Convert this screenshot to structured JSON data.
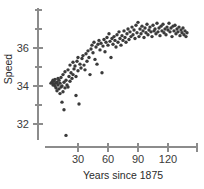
{
  "chart_data": {
    "type": "scatter",
    "title": "",
    "xlabel": "Years since 1875",
    "ylabel": "Speed",
    "xlim": [
      0,
      145
    ],
    "ylim": [
      31,
      37.5
    ],
    "xticks": [
      30,
      60,
      90,
      120
    ],
    "xtick_labels": [
      "30",
      "60",
      "90",
      "120"
    ],
    "yticks": [
      32,
      34,
      36
    ],
    "ytick_labels": [
      "32",
      "34",
      "36"
    ],
    "grid": false,
    "legend": null,
    "marker_color": "#3b3b3b",
    "axis_color": "#8c8c8c",
    "points": [
      [
        3,
        34.15
      ],
      [
        4,
        34.2
      ],
      [
        5,
        34.05
      ],
      [
        5,
        34.3
      ],
      [
        6,
        34.1
      ],
      [
        6,
        34.25
      ],
      [
        7,
        34.0
      ],
      [
        7,
        34.35
      ],
      [
        8,
        34.15
      ],
      [
        8,
        33.9
      ],
      [
        9,
        34.2
      ],
      [
        9,
        33.75
      ],
      [
        10,
        34.05
      ],
      [
        10,
        34.4
      ],
      [
        11,
        33.85
      ],
      [
        11,
        34.3
      ],
      [
        12,
        33.6
      ],
      [
        12,
        34.15
      ],
      [
        13,
        33.95
      ],
      [
        13,
        34.45
      ],
      [
        14,
        33.15
      ],
      [
        14,
        34.0
      ],
      [
        15,
        33.7
      ],
      [
        15,
        34.6
      ],
      [
        16,
        34.2
      ],
      [
        16,
        32.75
      ],
      [
        17,
        33.9
      ],
      [
        17,
        34.75
      ],
      [
        18,
        34.3
      ],
      [
        18,
        31.4
      ],
      [
        19,
        34.05
      ],
      [
        20,
        34.85
      ],
      [
        20,
        33.95
      ],
      [
        21,
        34.5
      ],
      [
        22,
        35.1
      ],
      [
        22,
        34.25
      ],
      [
        23,
        34.7
      ],
      [
        24,
        34.4
      ],
      [
        25,
        35.25
      ],
      [
        25,
        34.6
      ],
      [
        26,
        34.9
      ],
      [
        27,
        35.05
      ],
      [
        28,
        34.5
      ],
      [
        28,
        33.5
      ],
      [
        29,
        35.3
      ],
      [
        30,
        34.8
      ],
      [
        30,
        35.5
      ],
      [
        31,
        33.05
      ],
      [
        32,
        35.15
      ],
      [
        33,
        34.95
      ],
      [
        34,
        35.45
      ],
      [
        35,
        35.6
      ],
      [
        36,
        35.1
      ],
      [
        37,
        34.85
      ],
      [
        38,
        35.7
      ],
      [
        39,
        35.3
      ],
      [
        40,
        35.85
      ],
      [
        41,
        35.5
      ],
      [
        42,
        34.6
      ],
      [
        43,
        35.95
      ],
      [
        44,
        36.15
      ],
      [
        45,
        35.75
      ],
      [
        46,
        36.3
      ],
      [
        47,
        35.4
      ],
      [
        48,
        36.05
      ],
      [
        49,
        35.15
      ],
      [
        50,
        36.2
      ],
      [
        51,
        36.4
      ],
      [
        52,
        35.9
      ],
      [
        53,
        36.25
      ],
      [
        54,
        34.7
      ],
      [
        55,
        36.1
      ],
      [
        56,
        36.45
      ],
      [
        57,
        35.8
      ],
      [
        58,
        36.3
      ],
      [
        59,
        36.55
      ],
      [
        60,
        36.15
      ],
      [
        61,
        36.75
      ],
      [
        62,
        36.35
      ],
      [
        63,
        35.5
      ],
      [
        64,
        36.5
      ],
      [
        65,
        36.2
      ],
      [
        66,
        36.6
      ],
      [
        67,
        36.4
      ],
      [
        68,
        36.05
      ],
      [
        69,
        36.7
      ],
      [
        70,
        36.3
      ],
      [
        71,
        36.85
      ],
      [
        72,
        36.5
      ],
      [
        73,
        36.15
      ],
      [
        74,
        36.65
      ],
      [
        75,
        36.4
      ],
      [
        76,
        36.9
      ],
      [
        77,
        36.55
      ],
      [
        78,
        36.3
      ],
      [
        79,
        36.75
      ],
      [
        80,
        37.0
      ],
      [
        81,
        36.45
      ],
      [
        82,
        36.85
      ],
      [
        83,
        36.6
      ],
      [
        84,
        37.1
      ],
      [
        85,
        36.7
      ],
      [
        86,
        36.95
      ],
      [
        87,
        36.5
      ],
      [
        88,
        37.2
      ],
      [
        89,
        36.8
      ],
      [
        90,
        37.35
      ],
      [
        91,
        36.6
      ],
      [
        92,
        37.0
      ],
      [
        93,
        36.75
      ],
      [
        94,
        37.15
      ],
      [
        95,
        36.9
      ],
      [
        96,
        36.55
      ],
      [
        97,
        37.05
      ],
      [
        98,
        36.8
      ],
      [
        99,
        37.25
      ],
      [
        100,
        36.7
      ],
      [
        101,
        36.95
      ],
      [
        102,
        37.1
      ],
      [
        103,
        36.85
      ],
      [
        104,
        36.6
      ],
      [
        105,
        37.2
      ],
      [
        106,
        36.9
      ],
      [
        107,
        37.0
      ],
      [
        108,
        36.75
      ],
      [
        109,
        37.3
      ],
      [
        110,
        36.85
      ],
      [
        111,
        37.05
      ],
      [
        112,
        36.65
      ],
      [
        113,
        37.15
      ],
      [
        114,
        36.9
      ],
      [
        115,
        37.25
      ],
      [
        116,
        36.8
      ],
      [
        117,
        37.0
      ],
      [
        118,
        36.7
      ],
      [
        119,
        37.1
      ],
      [
        120,
        36.95
      ],
      [
        121,
        37.3
      ],
      [
        122,
        36.85
      ],
      [
        123,
        37.05
      ],
      [
        124,
        36.6
      ],
      [
        125,
        37.15
      ],
      [
        126,
        36.9
      ],
      [
        127,
        37.2
      ],
      [
        128,
        36.75
      ],
      [
        129,
        37.0
      ],
      [
        130,
        36.85
      ],
      [
        131,
        37.1
      ],
      [
        132,
        36.65
      ],
      [
        133,
        36.95
      ],
      [
        134,
        36.8
      ],
      [
        135,
        37.05
      ],
      [
        136,
        36.7
      ],
      [
        137,
        36.9
      ],
      [
        138,
        36.6
      ],
      [
        139,
        36.8
      ]
    ]
  }
}
